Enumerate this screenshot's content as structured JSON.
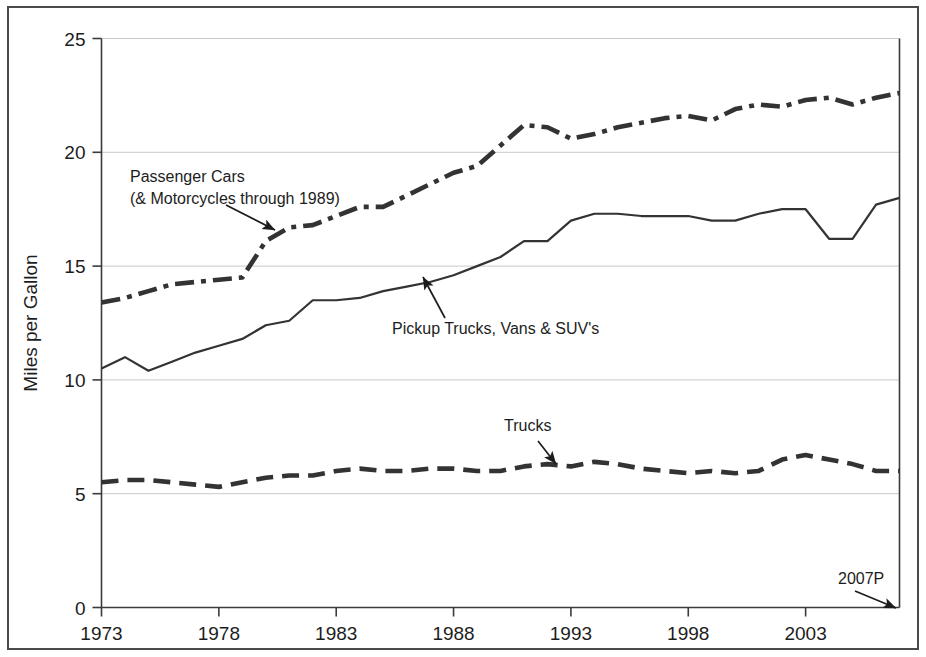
{
  "chart_data": {
    "type": "line",
    "title": "",
    "xlabel": "",
    "ylabel": "Miles per Gallon",
    "xlim": [
      1973,
      2007
    ],
    "ylim": [
      0,
      25
    ],
    "yticks": [
      0,
      5,
      10,
      15,
      20,
      25
    ],
    "ytick_labels": [
      "0",
      "5",
      "10",
      "15",
      "20",
      "25"
    ],
    "xticks": [
      1973,
      1978,
      1983,
      1988,
      1993,
      1998,
      2003
    ],
    "xtick_labels": [
      "1973",
      "1978",
      "1983",
      "1988",
      "1993",
      "1998",
      "2003"
    ],
    "grid": "horizontal",
    "legend_position": "inline-annotations",
    "x": [
      1973,
      1974,
      1975,
      1976,
      1977,
      1978,
      1979,
      1980,
      1981,
      1982,
      1983,
      1984,
      1985,
      1986,
      1987,
      1988,
      1989,
      1990,
      1991,
      1992,
      1993,
      1994,
      1995,
      1996,
      1997,
      1998,
      1999,
      2000,
      2001,
      2002,
      2003,
      2004,
      2005,
      2006,
      2007
    ],
    "series": [
      {
        "name": "Passenger Cars (& Motorcycles through 1989)",
        "style": "dash-dot",
        "color": "#555555",
        "values": [
          13.4,
          13.6,
          13.9,
          14.2,
          14.3,
          14.4,
          14.5,
          16.1,
          16.7,
          16.8,
          17.2,
          17.6,
          17.6,
          18.1,
          18.6,
          19.1,
          19.4,
          20.3,
          21.2,
          21.1,
          20.6,
          20.8,
          21.1,
          21.3,
          21.5,
          21.6,
          21.4,
          21.9,
          22.1,
          22.0,
          22.3,
          22.4,
          22.1,
          22.4,
          22.6
        ]
      },
      {
        "name": "Pickup Trucks, Vans & SUV's",
        "style": "solid",
        "color": "#333333",
        "values": [
          10.5,
          11.0,
          10.4,
          10.8,
          11.2,
          11.5,
          11.8,
          12.4,
          12.6,
          13.5,
          13.5,
          13.6,
          13.9,
          14.1,
          14.3,
          14.6,
          15.0,
          15.4,
          16.1,
          16.1,
          17.0,
          17.3,
          17.3,
          17.2,
          17.2,
          17.2,
          17.0,
          17.0,
          17.3,
          17.5,
          17.5,
          16.2,
          16.2,
          17.7,
          18.0
        ]
      },
      {
        "name": "Trucks",
        "style": "dashed",
        "color": "#333333",
        "values": [
          5.5,
          5.6,
          5.6,
          5.5,
          5.4,
          5.3,
          5.5,
          5.7,
          5.8,
          5.8,
          6.0,
          6.1,
          6.0,
          6.0,
          6.1,
          6.1,
          6.0,
          6.0,
          6.2,
          6.3,
          6.2,
          6.4,
          6.3,
          6.1,
          6.0,
          5.9,
          6.0,
          5.9,
          6.0,
          6.5,
          6.7,
          6.5,
          6.3,
          6.0,
          6.0
        ]
      }
    ],
    "annotations": [
      {
        "id": "passenger-cars-annotation",
        "line1": "Passenger Cars",
        "line2": "(& Motorcycles through 1989)",
        "text_x": 130,
        "text_y": 182,
        "arrow_from_x": 226,
        "arrow_from_y": 205,
        "arrow_to_x": 275,
        "arrow_to_y": 230
      },
      {
        "id": "pickup-trucks-annotation",
        "line1": "Pickup Trucks, Vans & SUV's",
        "line2": "",
        "text_x": 392,
        "text_y": 334,
        "arrow_from_x": 445,
        "arrow_from_y": 318,
        "arrow_to_x": 423,
        "arrow_to_y": 277
      },
      {
        "id": "trucks-annotation",
        "line1": "Trucks",
        "line2": "",
        "text_x": 504,
        "text_y": 431,
        "arrow_from_x": 538,
        "arrow_from_y": 441,
        "arrow_to_x": 556,
        "arrow_to_y": 464
      },
      {
        "id": "projection-year-annotation",
        "line1": "2007P",
        "line2": "",
        "text_x": 838,
        "text_y": 584,
        "arrow_from_x": 855,
        "arrow_from_y": 591,
        "arrow_to_x": 896,
        "arrow_to_y": 608
      }
    ]
  }
}
